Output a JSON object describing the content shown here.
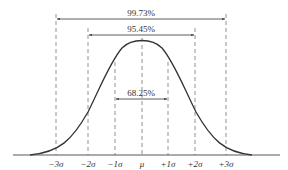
{
  "diagram": {
    "type": "normal-distribution",
    "intervals": [
      {
        "label": "99.73%",
        "from": "-3σ",
        "to": "+3σ"
      },
      {
        "label": "95.45%",
        "from": "-2σ",
        "to": "+2σ"
      },
      {
        "label": "68.25%",
        "from": "-1σ",
        "to": "+1σ"
      }
    ],
    "axis_labels": [
      "−3σ",
      "−2σ",
      "−1σ",
      "μ",
      "+1σ",
      "+2σ",
      "+3σ"
    ],
    "colors": {
      "line": "#333333",
      "dash": "#777777",
      "background": "#ffffff"
    }
  }
}
